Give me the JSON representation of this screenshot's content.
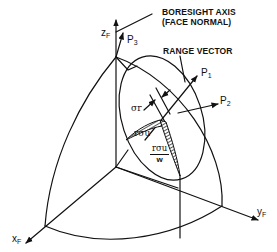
{
  "diagram": {
    "type": "3d-coordinate-geometry",
    "labels": {
      "boresight_line1": "BORESIGHT AXIS",
      "boresight_line2": "(FACE NORMAL)",
      "range_vector": "RANGE VECTOR",
      "axis_z": "z",
      "axis_z_sub": "F",
      "axis_x": "x",
      "axis_x_sub": "F",
      "axis_y": "y",
      "axis_y_sub": "F",
      "p1": "P",
      "p1_sub": "1",
      "p2": "P",
      "p2_sub": "2",
      "p3": "P",
      "p3_sub": "3",
      "sigma_r": "σr",
      "r_sigma_u": "rσu",
      "frac_numerator": "rσu",
      "frac_denominator": "w"
    },
    "colors": {
      "line": "#111111",
      "background": "#ffffff"
    }
  }
}
